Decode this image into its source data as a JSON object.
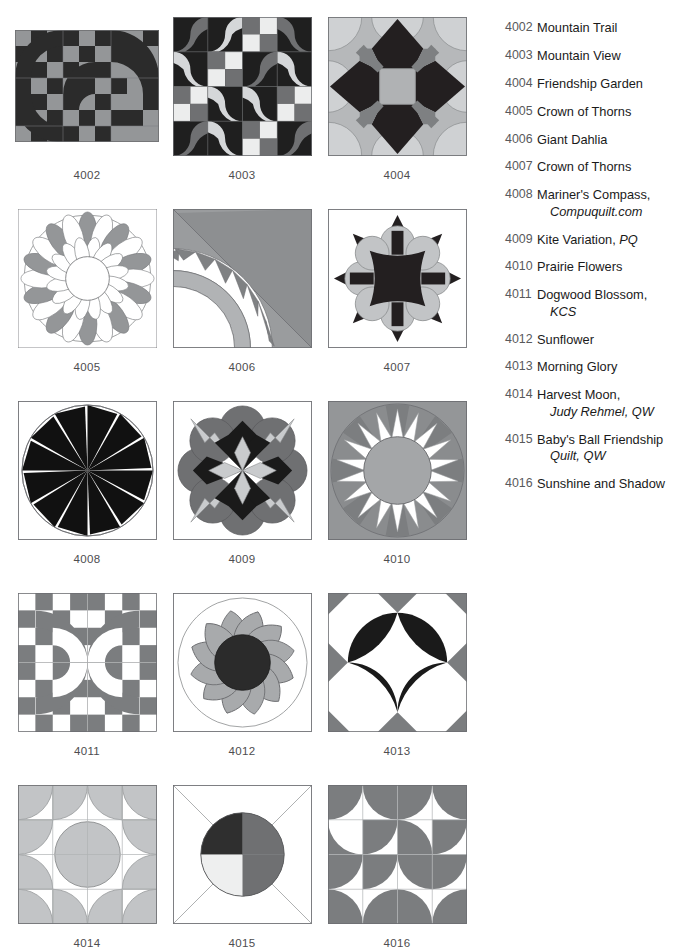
{
  "page": {
    "kind": "quilt-block-catalog-page",
    "background": "#ffffff"
  },
  "palette": {
    "dark": "#2b2b2b",
    "black": "#111111",
    "mid_gray": "#6f7072",
    "gray": "#929497",
    "light_gray": "#b8babc",
    "pale_gray": "#d0d2d3",
    "white": "#ffffff",
    "outline": "#6d6e71",
    "caption": "#4d4d4f",
    "number": "#58595b",
    "text": "#1a1a1a"
  },
  "blocks": [
    {
      "id": "4002",
      "caption": "4002",
      "name": "Mountain Trail"
    },
    {
      "id": "4003",
      "caption": "4003",
      "name": "Mountain View"
    },
    {
      "id": "4004",
      "caption": "4004",
      "name": "Friendship Garden"
    },
    {
      "id": "4005",
      "caption": "4005",
      "name": "Crown of Thorns"
    },
    {
      "id": "4006",
      "caption": "4006",
      "name": "Giant Dahlia"
    },
    {
      "id": "4007",
      "caption": "4007",
      "name": "Crown of Thorns"
    },
    {
      "id": "4008",
      "caption": "4008",
      "name": "Mariner's Compass"
    },
    {
      "id": "4009",
      "caption": "4009",
      "name": "Kite Variation"
    },
    {
      "id": "4010",
      "caption": "4010",
      "name": "Prairie Flowers"
    },
    {
      "id": "4011",
      "caption": "4011",
      "name": "Dogwood Blossom"
    },
    {
      "id": "4012",
      "caption": "4012",
      "name": "Sunflower"
    },
    {
      "id": "4013",
      "caption": "4013",
      "name": "Morning Glory"
    },
    {
      "id": "4014",
      "caption": "4014",
      "name": "Harvest Moon"
    },
    {
      "id": "4015",
      "caption": "4015",
      "name": "Baby's Ball Friendship Quilt"
    },
    {
      "id": "4016",
      "caption": "4016",
      "name": "Sunshine and Shadow"
    }
  ],
  "legend": {
    "items": [
      {
        "num": "4002",
        "name": "Mountain Trail",
        "attrib": "",
        "continuation": ""
      },
      {
        "num": "4003",
        "name": "Mountain View",
        "attrib": "",
        "continuation": ""
      },
      {
        "num": "4004",
        "name": "Friendship Garden",
        "attrib": "",
        "continuation": ""
      },
      {
        "num": "4005",
        "name": "Crown of Thorns",
        "attrib": "",
        "continuation": ""
      },
      {
        "num": "4006",
        "name": "Giant Dahlia",
        "attrib": "",
        "continuation": ""
      },
      {
        "num": "4007",
        "name": "Crown of Thorns",
        "attrib": "",
        "continuation": ""
      },
      {
        "num": "4008",
        "name": "Mariner's Compass,",
        "attrib": "",
        "continuation": "Compuquilt.com"
      },
      {
        "num": "4009",
        "name": "Kite Variation, ",
        "attrib": "PQ",
        "continuation": ""
      },
      {
        "num": "4010",
        "name": "Prairie Flowers",
        "attrib": "",
        "continuation": ""
      },
      {
        "num": "4011",
        "name": "Dogwood Blossom,",
        "attrib": "",
        "continuation": "KCS"
      },
      {
        "num": "4012",
        "name": "Sunflower",
        "attrib": "",
        "continuation": ""
      },
      {
        "num": "4013",
        "name": "Morning Glory",
        "attrib": "",
        "continuation": ""
      },
      {
        "num": "4014",
        "name": "Harvest Moon,",
        "attrib": "",
        "continuation": "Judy Rehmel, QW"
      },
      {
        "num": "4015",
        "name": "Baby's Ball Friendship",
        "attrib": "",
        "continuation": "Quilt, QW"
      },
      {
        "num": "4016",
        "name": "Sunshine and Shadow",
        "attrib": "",
        "continuation": ""
      }
    ]
  }
}
